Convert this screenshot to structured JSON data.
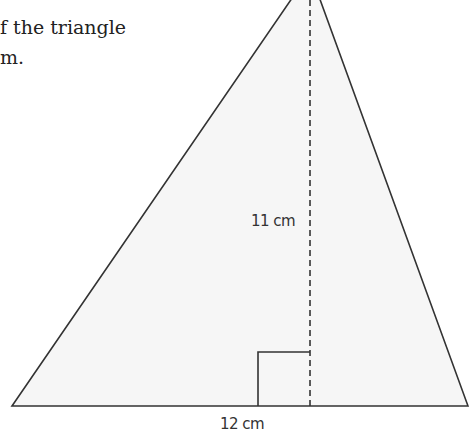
{
  "question": {
    "line1": "f the triangle",
    "line2": "m."
  },
  "diagram": {
    "shape": "triangle",
    "height_label": "11 cm",
    "base_label": "12 cm",
    "fill_color": "#f7f7f7",
    "stroke_color": "#333333"
  }
}
